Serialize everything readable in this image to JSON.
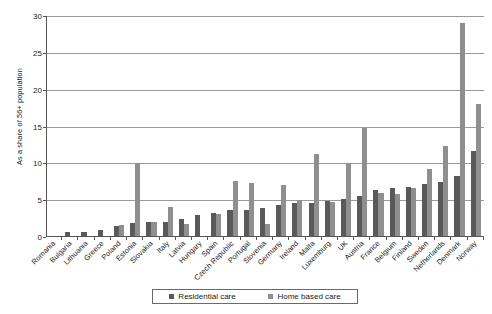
{
  "chart_data": {
    "type": "bar",
    "title": "",
    "xlabel": "",
    "ylabel": "As a share of 56+ population",
    "ylim": [
      0,
      30
    ],
    "yticks": [
      0,
      5,
      10,
      15,
      20,
      25,
      30
    ],
    "grid": true,
    "legend_position": "bottom",
    "categories": [
      "Romania",
      "Bulgaria",
      "Lithuania",
      "Greece",
      "Poland",
      "Estonia",
      "Slovakia",
      "Italy",
      "Latvia",
      "Hungary",
      "Spain",
      "Czech Republic",
      "Portugal",
      "Slovenia",
      "Germany",
      "Ireland",
      "Malta",
      "Luxemburg",
      "UK",
      "Austria",
      "France",
      "Belgium",
      "Finland",
      "Sweden",
      "Netherlands",
      "Denmark",
      "Norway"
    ],
    "series": [
      {
        "name": "Residential care",
        "color": "#595959",
        "values": [
          0.1,
          0.7,
          0.7,
          0.9,
          1.5,
          1.9,
          2.0,
          2.0,
          2.4,
          3.0,
          3.2,
          3.6,
          3.7,
          4.0,
          4.3,
          4.6,
          4.6,
          4.9,
          5.1,
          5.5,
          6.4,
          6.7,
          6.8,
          7.2,
          7.5,
          8.3,
          11.7
        ]
      },
      {
        "name": "Home based care",
        "color": "#8f8f8f",
        "values": [
          0.1,
          0.1,
          0.1,
          0.2,
          1.6,
          10.0,
          2.0,
          4.1,
          1.8,
          0.1,
          3.1,
          7.6,
          7.3,
          1.7,
          7.1,
          5.0,
          11.3,
          4.8,
          10.0,
          14.8,
          6.0,
          5.9,
          6.6,
          9.2,
          12.3,
          29.0,
          18.0
        ]
      }
    ]
  },
  "legend": {
    "items": [
      {
        "label": "Residential care"
      },
      {
        "label": "Home based care"
      }
    ]
  }
}
